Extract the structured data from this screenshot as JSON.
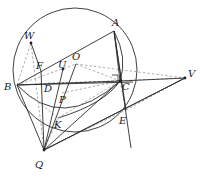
{
  "figure": {
    "kind": "geometry-diagram",
    "width": 203,
    "height": 184,
    "background": "#ffffff",
    "stroke_solid": "#2b2b2b",
    "stroke_dashed": "#8c8c8c",
    "point_fill": "#222222",
    "label_color": "#1a1a1a",
    "circle": {
      "cx": 75,
      "cy": 70,
      "r": 62
    },
    "points": [
      {
        "id": "A",
        "label": "A",
        "x": 114,
        "y": 31,
        "lx": 112,
        "ly": 18,
        "dot": false
      },
      {
        "id": "W",
        "label": "W",
        "x": 31,
        "y": 43,
        "lx": 24,
        "ly": 31,
        "dot": true
      },
      {
        "id": "O",
        "label": "O",
        "x": 76,
        "y": 64,
        "lx": 72,
        "ly": 52,
        "dot": false
      },
      {
        "id": "U",
        "label": "U",
        "x": 63,
        "y": 69,
        "lx": 58,
        "ly": 60,
        "dot": true
      },
      {
        "id": "F",
        "label": "F",
        "x": 41,
        "y": 71,
        "lx": 36,
        "ly": 61,
        "dot": false
      },
      {
        "id": "B",
        "label": "B",
        "x": 17,
        "y": 85,
        "lx": 4,
        "ly": 82,
        "dot": false
      },
      {
        "id": "D",
        "label": "D",
        "x": 48,
        "y": 83,
        "lx": 44,
        "ly": 84,
        "dot": false
      },
      {
        "id": "C",
        "label": "C",
        "x": 120,
        "y": 81,
        "lx": 122,
        "ly": 82,
        "dot": true
      },
      {
        "id": "V",
        "label": "V",
        "x": 185,
        "y": 78,
        "lx": 188,
        "ly": 69,
        "dot": true
      },
      {
        "id": "P",
        "label": "P",
        "x": 62,
        "y": 93,
        "lx": 59,
        "ly": 95,
        "dot": false
      },
      {
        "id": "K",
        "label": "K",
        "x": 58,
        "y": 118,
        "lx": 54,
        "ly": 120,
        "dot": false
      },
      {
        "id": "E",
        "label": "E",
        "x": 126,
        "y": 110,
        "lx": 119,
        "ly": 116,
        "dot": false
      },
      {
        "id": "Q",
        "label": "Q",
        "x": 44,
        "y": 150,
        "lx": 35,
        "ly": 160,
        "dot": true
      }
    ],
    "solid_segments": [
      {
        "name": "segment-B-A",
        "from": "B",
        "to": "A"
      },
      {
        "name": "segment-B-C",
        "from": "B",
        "to": "C"
      },
      {
        "name": "segment-B-Q",
        "from": "B",
        "to": "Q"
      },
      {
        "name": "segment-A-C",
        "from": "A",
        "to": "C"
      },
      {
        "name": "segment-C-V",
        "from": "C",
        "to": "V"
      },
      {
        "name": "segment-Q-V",
        "from": "Q",
        "to": "V"
      },
      {
        "name": "segment-Q-U",
        "from": "Q",
        "to": "U"
      },
      {
        "name": "segment-Q-O",
        "from": "Q",
        "to": "O"
      },
      {
        "name": "segment-Q-F",
        "from": "Q",
        "to": "F"
      },
      {
        "name": "segment-Q-C",
        "from": "Q",
        "to": "C"
      },
      {
        "name": "segment-W-F",
        "from": "W",
        "to": "F"
      },
      {
        "name": "segment-A-E-line",
        "from": "A",
        "to": "E"
      }
    ],
    "dashed_segments": [
      {
        "name": "dashed-B-W",
        "from": "B",
        "to": "W"
      },
      {
        "name": "dashed-W-Q",
        "from": "W",
        "to": "Q"
      },
      {
        "name": "dashed-B-O",
        "from": "B",
        "to": "O"
      },
      {
        "name": "dashed-O-C",
        "from": "O",
        "to": "C"
      },
      {
        "name": "dashed-O-V",
        "from": "O",
        "to": "V"
      },
      {
        "name": "dashed-B-V",
        "from": "B",
        "to": "V"
      },
      {
        "name": "dashed-B-K",
        "from": "B",
        "to": "K"
      },
      {
        "name": "dashed-K-C",
        "from": "K",
        "to": "C"
      },
      {
        "name": "dashed-D-C",
        "from": "D",
        "to": "C"
      },
      {
        "name": "dashed-P-C",
        "from": "P",
        "to": "C"
      },
      {
        "name": "dashed-Q-K",
        "from": "Q",
        "to": "K"
      },
      {
        "name": "dashed-Q-E",
        "from": "Q",
        "to": "E"
      },
      {
        "name": "dashed-C-E",
        "from": "C",
        "to": "E"
      },
      {
        "name": "dashed-E-right",
        "from": "E",
        "to": "V"
      }
    ],
    "markers": {
      "right_angle_at_C": {
        "x": 112,
        "y": 75,
        "size": 6
      }
    }
  }
}
